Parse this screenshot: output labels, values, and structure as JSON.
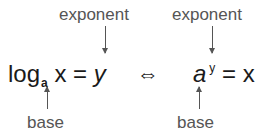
{
  "left": {
    "exponent_label": "exponent",
    "base_label": "base",
    "log": "log",
    "base_sub": "a",
    "x": "x",
    "equals": "=",
    "y": "y"
  },
  "iff": "⇔",
  "right": {
    "exponent_label": "exponent",
    "base_label": "base",
    "a": "a",
    "exp_sup": "y",
    "equals": "=",
    "x": "x"
  },
  "colors": {
    "label": "#555555",
    "equation": "#1a1a1a"
  }
}
